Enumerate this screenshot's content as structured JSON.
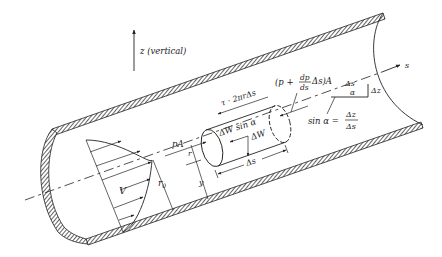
{
  "figure": {
    "type": "pipe-flow-free-body-diagram"
  },
  "labels": {
    "z_axis": "z (vertical)",
    "s_axis": "s",
    "velocity": "V",
    "radius_wall": "r",
    "radius_wall_sub": "0",
    "radius_elem": "r",
    "distance_y": "y",
    "pressure_force_left": "pA",
    "shear_force": "τ · 2πrΔs",
    "weight_component": "ΔW sin α",
    "weight": "ΔW",
    "element_length": "Δs",
    "pressure_force_right_prefix": "(p +",
    "pressure_force_right_num": "dp",
    "pressure_force_right_den": "ds",
    "pressure_force_right_suffix": "Δs)A",
    "triangle_hyp": "Δs",
    "triangle_angle": "α",
    "triangle_rise": "Δz",
    "sin_lhs": "sin α =",
    "sin_num": "Δz",
    "sin_den": "Δs"
  },
  "colors": {
    "ink": "#222222",
    "background": "#ffffff"
  }
}
